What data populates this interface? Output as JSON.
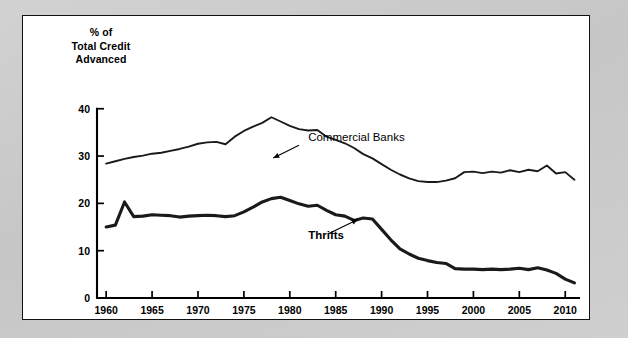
{
  "figure": {
    "panel_background": "#ffffff",
    "mat_background": "#c9c9c9",
    "border_color": "#111111"
  },
  "chart_data": {
    "type": "line",
    "title": "",
    "subtitle": "",
    "ylabel": "% of\nTotal Credit\nAdvanced",
    "xlabel": "",
    "xlim": [
      1959,
      2011.5
    ],
    "ylim": [
      0,
      41
    ],
    "yticks": [
      0,
      10,
      20,
      30,
      40
    ],
    "ytick_labels": [
      "0",
      "10",
      "20",
      "30",
      "40"
    ],
    "xticks": [
      1960,
      1965,
      1970,
      1975,
      1980,
      1985,
      1990,
      1995,
      2000,
      2005,
      2010
    ],
    "xtick_labels": [
      "1960",
      "1965",
      "1970",
      "1975",
      "1980",
      "1985",
      "1990",
      "1995",
      "2000",
      "2005",
      "2010"
    ],
    "grid": false,
    "legend_position": "inline-annotations",
    "line_color": "#1a1a1a",
    "annotations": [
      {
        "name": "commercial-banks",
        "text": "Commercial Banks",
        "bold": false,
        "label_x": 1982.0,
        "label_y": 33.2,
        "arrow_from_x": 1981.0,
        "arrow_from_y": 32.3,
        "arrow_to_x": 1978.2,
        "arrow_to_y": 29.6
      },
      {
        "name": "thrifts",
        "text": "Thrifts",
        "bold": true,
        "label_x": 1982.0,
        "label_y": 12.4,
        "arrow_from_x": 1984.2,
        "arrow_from_y": 13.6,
        "arrow_to_x": 1987.4,
        "arrow_to_y": 16.6
      }
    ],
    "x": [
      1960,
      1961,
      1962,
      1963,
      1964,
      1965,
      1966,
      1967,
      1968,
      1969,
      1970,
      1971,
      1972,
      1973,
      1974,
      1975,
      1976,
      1977,
      1978,
      1979,
      1980,
      1981,
      1982,
      1983,
      1984,
      1985,
      1986,
      1987,
      1988,
      1989,
      1990,
      1991,
      1992,
      1993,
      1994,
      1995,
      1996,
      1997,
      1998,
      1999,
      2000,
      2001,
      2002,
      2003,
      2004,
      2005,
      2006,
      2007,
      2008,
      2009,
      2010,
      2011
    ],
    "series": [
      {
        "name": "Commercial Banks",
        "style": "thin",
        "values": [
          28.4,
          28.9,
          29.4,
          29.8,
          30.1,
          30.5,
          30.7,
          31.1,
          31.5,
          32.0,
          32.6,
          32.9,
          33.0,
          32.5,
          34.1,
          35.3,
          36.2,
          37.0,
          38.2,
          37.3,
          36.4,
          35.7,
          35.4,
          35.5,
          34.1,
          33.4,
          32.7,
          31.7,
          30.4,
          29.5,
          28.3,
          27.1,
          26.1,
          25.3,
          24.7,
          24.5,
          24.5,
          24.8,
          25.3,
          26.6,
          26.7,
          26.4,
          26.7,
          26.5,
          27.0,
          26.6,
          27.1,
          26.8,
          28.0,
          26.3,
          26.6,
          25.0
        ]
      },
      {
        "name": "Thrifts",
        "style": "thick",
        "values": [
          15.0,
          15.4,
          20.3,
          17.2,
          17.3,
          17.6,
          17.5,
          17.4,
          17.1,
          17.3,
          17.4,
          17.5,
          17.4,
          17.2,
          17.4,
          18.2,
          19.2,
          20.3,
          21.0,
          21.3,
          20.6,
          19.9,
          19.4,
          19.6,
          18.5,
          17.6,
          17.3,
          16.4,
          16.9,
          16.7,
          14.5,
          12.3,
          10.4,
          9.3,
          8.4,
          7.9,
          7.5,
          7.3,
          6.2,
          6.1,
          6.1,
          6.0,
          6.1,
          6.0,
          6.1,
          6.3,
          6.0,
          6.4,
          5.9,
          5.2,
          4.0,
          3.2
        ]
      }
    ]
  }
}
